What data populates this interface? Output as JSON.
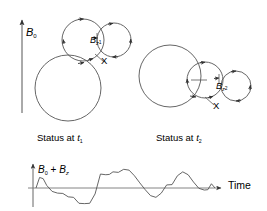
{
  "figure": {
    "stroke_color": "#4a4a4a",
    "text_color": "#000000",
    "background": "#ffffff"
  },
  "axis_b0": {
    "label": "B",
    "subscript": "0",
    "icon": "up-arrow-icon",
    "direction": "up"
  },
  "panel_t1": {
    "caption_prefix": "Status at ",
    "caption_var": "t",
    "caption_sub": "1",
    "circles": [
      {
        "name": "large-spin-circle",
        "cx": 68,
        "cy": 88,
        "r": 33,
        "arrow": "counterclockwise"
      },
      {
        "name": "medium-spin-circle",
        "cx": 83,
        "cy": 40,
        "r": 21,
        "arrow": "clockwise"
      },
      {
        "name": "small-spin-circle",
        "cx": 114,
        "cy": 40,
        "r": 17,
        "arrow": "clockwise"
      }
    ],
    "bz_label": "B",
    "bz_sub_main": "z",
    "bz_sub_index": "1",
    "x_label": "X"
  },
  "panel_t2": {
    "caption_prefix": "Status at ",
    "caption_var": "t",
    "caption_sub": "2",
    "circles": [
      {
        "name": "large-spin-circle",
        "cx": 170,
        "cy": 76,
        "r": 31,
        "arrow": "counterclockwise"
      },
      {
        "name": "medium-spin-circle",
        "cx": 205,
        "cy": 80,
        "r": 18,
        "arrow": "clockwise"
      },
      {
        "name": "small-spin-circle",
        "cx": 236,
        "cy": 86,
        "r": 15,
        "arrow": "clockwise"
      }
    ],
    "bz_label": "B",
    "bz_sub_main": "z",
    "bz_sub_index": "2",
    "x_label": "X"
  },
  "chart_data": {
    "type": "line",
    "title": "",
    "ylabel_parts": [
      "B",
      "0",
      " + ",
      "B",
      "z"
    ],
    "ylabel_text": "B0 + Bz",
    "xlabel": "Time",
    "grid": false,
    "legend": "none",
    "xlim": [
      0,
      100
    ],
    "ylim": [
      -1.25,
      1.35
    ],
    "baseline": 0,
    "x": [
      0,
      2,
      4,
      6,
      9,
      12,
      15,
      18,
      21,
      24,
      27,
      30,
      33,
      36,
      39,
      41,
      43,
      46,
      49,
      52,
      55,
      58,
      61,
      64,
      67,
      70,
      73,
      76,
      79,
      82,
      85,
      88,
      91,
      94,
      96,
      98,
      100
    ],
    "y": [
      0.0,
      0.62,
      0.55,
      0.15,
      -0.2,
      -0.3,
      -0.32,
      -0.52,
      -0.55,
      -0.9,
      -0.92,
      -0.9,
      -0.35,
      0.82,
      0.78,
      0.8,
      0.95,
      0.92,
      1.1,
      1.05,
      0.72,
      0.3,
      -0.1,
      -0.45,
      -0.55,
      -0.3,
      0.18,
      0.2,
      0.72,
      0.95,
      0.78,
      0.35,
      -0.02,
      -0.12,
      -0.1,
      0.25,
      0.0
    ],
    "series": [
      {
        "name": "B0 + Bz",
        "values": [
          0.0,
          0.62,
          0.55,
          0.15,
          -0.2,
          -0.3,
          -0.32,
          -0.52,
          -0.55,
          -0.9,
          -0.92,
          -0.9,
          -0.35,
          0.82,
          0.78,
          0.8,
          0.95,
          0.92,
          1.1,
          1.05,
          0.72,
          0.3,
          -0.1,
          -0.45,
          -0.55,
          -0.3,
          0.18,
          0.2,
          0.72,
          0.95,
          0.78,
          0.35,
          -0.02,
          -0.12,
          -0.1,
          0.25,
          0.0
        ]
      }
    ]
  }
}
